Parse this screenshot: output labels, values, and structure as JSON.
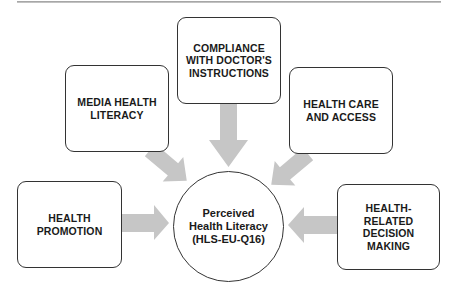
{
  "diagram": {
    "center": {
      "label": "Perceived Health Literacy (HLS-EU-Q16)"
    },
    "factors": [
      {
        "id": "compliance",
        "label": "COMPLIANCE WITH DOCTOR'S INSTRUCTIONS"
      },
      {
        "id": "media",
        "label": "MEDIA HEALTH LITERACY"
      },
      {
        "id": "healthcare",
        "label": "HEALTH CARE AND ACCESS"
      },
      {
        "id": "promotion",
        "label": "HEALTH PROMOTION"
      },
      {
        "id": "decision",
        "label": "HEALTH-RELATED DECISION MAKING"
      }
    ],
    "colors": {
      "arrow": "#c6c6c6",
      "border": "#333333",
      "text": "#1a1a1a"
    }
  }
}
